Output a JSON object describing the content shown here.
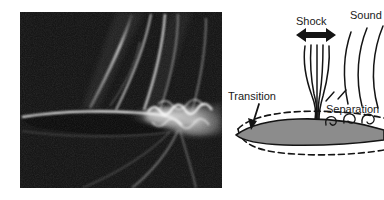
{
  "figure": {
    "background_color": "#ffffff",
    "width": 384,
    "height": 200
  },
  "photo": {
    "name": "schlieren-photograph",
    "description": "Schlieren photograph of transonic airfoil with shock wave and separated turbulent wake",
    "background_color": "#0a0a0a",
    "highlight_color": "#f2f2f2",
    "frame": {
      "x": 20,
      "y": 12,
      "width": 202,
      "height": 176
    }
  },
  "diagram": {
    "name": "transonic-buffet-schematic",
    "stroke_color": "#141414",
    "airfoil_fill_color": "#8c8c8c",
    "boundary_layer_style": "dashed",
    "labels": [
      {
        "id": "shock",
        "text": "Shock",
        "x": 96,
        "y": 22
      },
      {
        "id": "sound",
        "text": "Sound",
        "x": 150,
        "y": 16
      },
      {
        "id": "transition",
        "text": "Transition",
        "x": 10,
        "y": 96
      },
      {
        "id": "separation",
        "text": "Separation",
        "x": 110,
        "y": 114
      }
    ],
    "annotations": {
      "shock_arrow": "double-headed-horizontal-arrow",
      "transition_arrow": "down-arrow",
      "shock_lines_count": 5,
      "sound_arc_count": 3,
      "vortex_count": 3
    }
  }
}
